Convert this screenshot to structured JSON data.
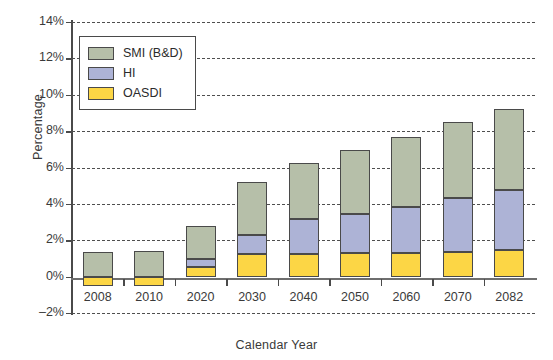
{
  "chart_data": {
    "type": "bar",
    "stacked": true,
    "title": "",
    "subtitle": "",
    "xlabel": "Calendar Year",
    "ylabel": "Percentage",
    "categories": [
      "2008",
      "2010",
      "2020",
      "2030",
      "2040",
      "2050",
      "2060",
      "2070",
      "2082"
    ],
    "series": [
      {
        "name": "OASDI",
        "color": "#fcd645",
        "values": [
          -0.5,
          -0.5,
          0.55,
          1.25,
          1.25,
          1.3,
          1.3,
          1.35,
          1.45
        ]
      },
      {
        "name": "HI",
        "color": "#adb3d6",
        "values": [
          0.0,
          0.0,
          0.4,
          1.05,
          1.9,
          2.15,
          2.55,
          2.95,
          3.3
        ]
      },
      {
        "name": "SMI (B&D)",
        "color": "#b6bfa9",
        "values": [
          1.35,
          1.4,
          1.85,
          2.9,
          3.1,
          3.5,
          3.85,
          4.2,
          4.45
        ]
      }
    ],
    "stack_tops": {
      "oasdi_top": [
        -0.5,
        -0.5,
        0.55,
        1.25,
        1.25,
        1.3,
        1.3,
        1.35,
        1.45
      ],
      "hi_top": [
        0.0,
        0.0,
        0.95,
        2.3,
        3.15,
        3.45,
        3.85,
        4.3,
        4.75
      ],
      "smi_top": [
        1.35,
        1.4,
        2.8,
        5.2,
        6.25,
        6.95,
        7.7,
        8.5,
        9.2
      ]
    },
    "totals": [
      1.35,
      1.4,
      2.8,
      5.2,
      6.25,
      6.95,
      7.7,
      8.5,
      9.2
    ],
    "ylim": [
      -2,
      14
    ],
    "ytick_values": [
      -2,
      0,
      2,
      4,
      6,
      8,
      10,
      12,
      14
    ],
    "ytick_labels": [
      "–2%",
      "0%",
      "2%",
      "4%",
      "6%",
      "8%",
      "10%",
      "12%",
      "14%"
    ],
    "grid": "horizontal-dashed",
    "legend_position": "top-left",
    "legend_entries": [
      "SMI (B&D)",
      "HI",
      "OASDI"
    ]
  },
  "legend": {
    "items": [
      {
        "label": "SMI (B&D)",
        "key": "smi"
      },
      {
        "label": "HI",
        "key": "hi"
      },
      {
        "label": "OASDI",
        "key": "oasdi"
      }
    ]
  },
  "axes": {
    "y_title": "Percentage",
    "x_title": "Calendar Year"
  },
  "colors": {
    "oasdi": "#fcd645",
    "hi": "#adb3d6",
    "smi": "#b6bfa9",
    "stroke": "#4a4a4a",
    "grid": "#4f4f4f",
    "text": "#3a3a3a",
    "background": "#ffffff"
  }
}
